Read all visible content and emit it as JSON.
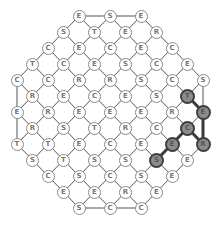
{
  "game": {
    "type": "letter-grid word puzzle",
    "found_word": "SECRET",
    "colors": {
      "node_fill": "#ffffff",
      "node_border": "#8a8a8a",
      "letter": "#777777",
      "highlight_fill": "#8c8c8c",
      "highlight_border": "#3f3f3f",
      "edge": "#555555"
    },
    "rows": [
      {
        "y": 16,
        "cells": [
          {
            "c": 4,
            "l": "E"
          },
          {
            "c": 6,
            "l": "S"
          },
          {
            "c": 8,
            "l": "E"
          }
        ]
      },
      {
        "y": 32,
        "cells": [
          {
            "c": 3,
            "l": "S"
          },
          {
            "c": 5,
            "l": "T"
          },
          {
            "c": 7,
            "l": "E"
          },
          {
            "c": 9,
            "l": "R"
          }
        ]
      },
      {
        "y": 48,
        "cells": [
          {
            "c": 2,
            "l": "C"
          },
          {
            "c": 4,
            "l": "E"
          },
          {
            "c": 6,
            "l": "C"
          },
          {
            "c": 8,
            "l": "E"
          },
          {
            "c": 10,
            "l": "C"
          }
        ]
      },
      {
        "y": 64,
        "cells": [
          {
            "c": 1,
            "l": "T"
          },
          {
            "c": 3,
            "l": "C"
          },
          {
            "c": 5,
            "l": "E"
          },
          {
            "c": 7,
            "l": "S"
          },
          {
            "c": 9,
            "l": "C"
          },
          {
            "c": 11,
            "l": "E"
          }
        ]
      },
      {
        "y": 80,
        "cells": [
          {
            "c": 0,
            "l": "C"
          },
          {
            "c": 2,
            "l": "C"
          },
          {
            "c": 4,
            "l": "R"
          },
          {
            "c": 6,
            "l": "R"
          },
          {
            "c": 8,
            "l": "S"
          },
          {
            "c": 10,
            "l": "C"
          },
          {
            "c": 12,
            "l": "S"
          }
        ]
      },
      {
        "y": 96,
        "cells": [
          {
            "c": 1,
            "l": "R"
          },
          {
            "c": 3,
            "l": "E"
          },
          {
            "c": 5,
            "l": "C"
          },
          {
            "c": 7,
            "l": "E"
          },
          {
            "c": 9,
            "l": "S"
          },
          {
            "c": 11,
            "l": "T",
            "hl": true
          }
        ]
      },
      {
        "y": 112,
        "cells": [
          {
            "c": 0,
            "l": "E"
          },
          {
            "c": 2,
            "l": "R"
          },
          {
            "c": 4,
            "l": "E"
          },
          {
            "c": 6,
            "l": "E"
          },
          {
            "c": 8,
            "l": "E"
          },
          {
            "c": 10,
            "l": "R"
          },
          {
            "c": 12,
            "l": "E",
            "hl": true
          }
        ]
      },
      {
        "y": 128,
        "cells": [
          {
            "c": 1,
            "l": "R"
          },
          {
            "c": 3,
            "l": "S"
          },
          {
            "c": 5,
            "l": "T"
          },
          {
            "c": 7,
            "l": "R"
          },
          {
            "c": 9,
            "l": "C"
          },
          {
            "c": 11,
            "l": "C",
            "hl": true
          }
        ]
      },
      {
        "y": 144,
        "cells": [
          {
            "c": 0,
            "l": "T"
          },
          {
            "c": 2,
            "l": "T"
          },
          {
            "c": 4,
            "l": "E"
          },
          {
            "c": 6,
            "l": "C"
          },
          {
            "c": 8,
            "l": "E"
          },
          {
            "c": 10,
            "l": "E",
            "hl": true
          },
          {
            "c": 12,
            "l": "R",
            "hl": true
          }
        ]
      },
      {
        "y": 160,
        "cells": [
          {
            "c": 1,
            "l": "S"
          },
          {
            "c": 3,
            "l": "T"
          },
          {
            "c": 5,
            "l": "S"
          },
          {
            "c": 7,
            "l": "S"
          },
          {
            "c": 9,
            "l": "S",
            "hl": true
          },
          {
            "c": 11,
            "l": "E"
          }
        ]
      },
      {
        "y": 176,
        "cells": [
          {
            "c": 2,
            "l": "C"
          },
          {
            "c": 4,
            "l": "S"
          },
          {
            "c": 6,
            "l": "C"
          },
          {
            "c": 8,
            "l": "S"
          },
          {
            "c": 10,
            "l": "E"
          }
        ]
      },
      {
        "y": 192,
        "cells": [
          {
            "c": 3,
            "l": "E"
          },
          {
            "c": 5,
            "l": "E"
          },
          {
            "c": 7,
            "l": "R"
          },
          {
            "c": 9,
            "l": "E"
          }
        ]
      },
      {
        "y": 208,
        "cells": [
          {
            "c": 4,
            "l": "S"
          },
          {
            "c": 6,
            "l": "C"
          },
          {
            "c": 8,
            "l": "C"
          }
        ]
      }
    ],
    "highlight_path": [
      [
        9,
        9
      ],
      [
        8,
        10
      ],
      [
        7,
        11
      ],
      [
        8,
        12
      ],
      [
        6,
        12
      ],
      [
        5,
        11
      ]
    ]
  }
}
